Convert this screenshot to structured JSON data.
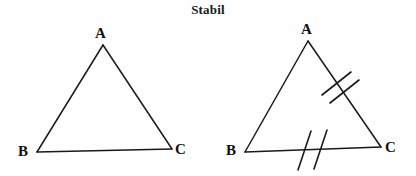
{
  "figure": {
    "title": "Stabil",
    "background_color": "#fefefe",
    "stroke_color": "#1a1a1a"
  },
  "diagrams": [
    {
      "id": "triangle-left",
      "name": "plain-triangle",
      "vertices": {
        "A": {
          "label": "A",
          "x": 103,
          "y": 45
        },
        "B": {
          "label": "B",
          "x": 37,
          "y": 152
        },
        "C": {
          "label": "C",
          "x": 172,
          "y": 149
        }
      },
      "tick_marks": []
    },
    {
      "id": "triangle-right",
      "name": "triangle-with-congruence-ticks",
      "vertices": {
        "A": {
          "label": "A",
          "x": 308,
          "y": 41
        },
        "B": {
          "label": "B",
          "x": 245,
          "y": 152
        },
        "C": {
          "label": "C",
          "x": 381,
          "y": 147
        }
      },
      "tick_marks": [
        {
          "side": "AC",
          "count": 2
        },
        {
          "side": "BC",
          "count": 2
        }
      ]
    }
  ]
}
